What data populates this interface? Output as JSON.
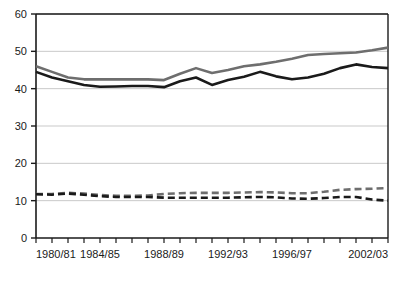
{
  "chart_data": {
    "type": "line",
    "title": "",
    "subtitle": "",
    "xlabel": "",
    "ylabel": "",
    "grid": true,
    "legend": "none",
    "ylim": [
      0,
      60
    ],
    "yticks": [
      0,
      10,
      20,
      30,
      40,
      50,
      60
    ],
    "ytick_labels": [
      "0",
      "10",
      "20",
      "30",
      "40",
      "50",
      "60"
    ],
    "x": [
      "1980/81",
      "1981/82",
      "1982/83",
      "1983/84",
      "1984/85",
      "1985/86",
      "1986/87",
      "1987/88",
      "1988/89",
      "1989/90",
      "1990/91",
      "1991/92",
      "1992/93",
      "1993/94",
      "1994/95",
      "1995/96",
      "1996/97",
      "1997/98",
      "1998/99",
      "1999/00",
      "2000/01",
      "2001/02",
      "2002/03"
    ],
    "xtick_labels": [
      "1980/81",
      "",
      "",
      "",
      "1984/85",
      "",
      "",
      "",
      "1988/89",
      "",
      "",
      "",
      "1992/93",
      "",
      "",
      "",
      "1996/97",
      "",
      "",
      "",
      "",
      "",
      "2002/03"
    ],
    "xtick_label_indices": [
      0,
      4,
      8,
      12,
      16,
      22
    ],
    "series": [
      {
        "name": "series-grey-solid",
        "color": "#6e6e6e",
        "style": "solid",
        "width": 2.6,
        "values": [
          46.0,
          44.5,
          43.0,
          42.5,
          42.5,
          42.5,
          42.5,
          42.5,
          42.3,
          44.0,
          45.5,
          44.2,
          45.0,
          46.0,
          46.5,
          47.2,
          48.0,
          49.0,
          49.3,
          49.5,
          49.7,
          50.3,
          51.0
        ]
      },
      {
        "name": "series-black-solid",
        "color": "#1a1a1a",
        "style": "solid",
        "width": 2.6,
        "values": [
          44.5,
          43.0,
          42.0,
          41.0,
          40.5,
          40.6,
          40.7,
          40.7,
          40.4,
          42.0,
          43.0,
          41.0,
          42.3,
          43.2,
          44.5,
          43.3,
          42.5,
          43.0,
          44.0,
          45.5,
          46.5,
          45.8,
          45.5
        ]
      },
      {
        "name": "series-grey-dashed",
        "color": "#6e6e6e",
        "style": "dashed",
        "width": 2.6,
        "values": [
          11.8,
          11.8,
          12.1,
          11.9,
          11.5,
          11.3,
          11.3,
          11.4,
          11.8,
          12.0,
          12.1,
          12.1,
          12.1,
          12.2,
          12.3,
          12.2,
          12.0,
          12.0,
          12.4,
          12.9,
          13.1,
          13.2,
          13.4
        ]
      },
      {
        "name": "series-black-dashed",
        "color": "#1a1a1a",
        "style": "dashed",
        "width": 2.6,
        "values": [
          11.7,
          11.6,
          11.9,
          11.6,
          11.2,
          11.0,
          11.0,
          11.0,
          10.8,
          10.8,
          10.8,
          10.8,
          10.8,
          10.9,
          11.0,
          10.9,
          10.6,
          10.5,
          10.7,
          11.0,
          11.0,
          10.3,
          10.0
        ]
      }
    ],
    "colors": {
      "axis": "#1a1a1a",
      "grid": "#c9c9c9",
      "grey_series": "#6e6e6e",
      "black_series": "#1a1a1a",
      "background": "#ffffff"
    }
  }
}
